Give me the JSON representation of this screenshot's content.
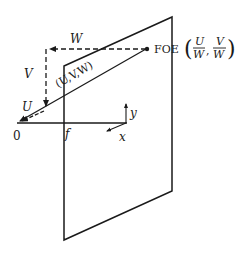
{
  "diagram": {
    "type": "focus-of-expansion camera geometry",
    "labels": {
      "origin": "0",
      "focal": "f",
      "x_axis": "x",
      "y_axis": "y",
      "U": "U",
      "V": "V",
      "W": "W",
      "velocity": "(U,V,W)",
      "foe": "FOE",
      "foe_coord_u_num": "U",
      "foe_coord_u_den": "W",
      "foe_coord_v_num": "V",
      "foe_coord_v_den": "W",
      "comma": ","
    },
    "colors": {
      "stroke": "#1a1a1a",
      "background": "#ffffff"
    }
  }
}
